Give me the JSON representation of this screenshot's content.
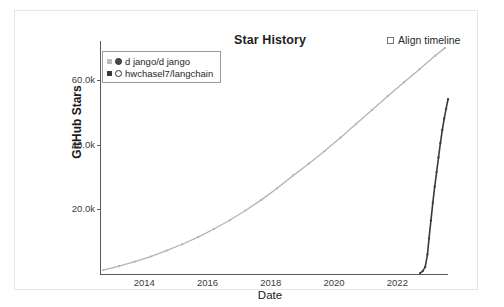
{
  "card": {
    "background": "#ffffff",
    "border_color": "#e6e6e6"
  },
  "header": {
    "title": "Star History",
    "align_timeline_label": "Align timeline",
    "align_timeline_checked": false
  },
  "chart_data": {
    "type": "line",
    "title": "Star History",
    "xlabel": "Date",
    "ylabel": "GitHub Stars",
    "grid": false,
    "legend_position": "top-left",
    "xlim": [
      2012.6,
      2023.6
    ],
    "ylim": [
      0,
      72000
    ],
    "x_ticks": [
      "2014",
      "2016",
      "2018",
      "2020",
      "2022"
    ],
    "x_tick_values": [
      2014,
      2016,
      2018,
      2020,
      2022
    ],
    "y_ticks": [
      "20.0k",
      "40.0k",
      "60.0k"
    ],
    "y_tick_values": [
      20000,
      40000,
      60000
    ],
    "series": [
      {
        "name": "d jango/d jango",
        "color": "#b4b4b4",
        "marker": "circle",
        "x": [
          2012.7,
          2013.2,
          2013.7,
          2014.2,
          2014.7,
          2015.2,
          2015.7,
          2016.2,
          2016.7,
          2017.2,
          2017.7,
          2018.2,
          2018.7,
          2019.2,
          2019.7,
          2020.2,
          2020.7,
          2021.2,
          2021.7,
          2022.2,
          2022.7,
          2023.2,
          2023.5
        ],
        "values": [
          1200,
          2400,
          3800,
          5400,
          7200,
          9200,
          11400,
          13900,
          16600,
          19600,
          22900,
          26500,
          30400,
          34100,
          38000,
          42100,
          46400,
          50700,
          55000,
          59200,
          63300,
          67500,
          69800
        ]
      },
      {
        "name": "hwchasel7/langchain",
        "color": "#3a3a3a",
        "marker": "circle",
        "x": [
          2022.72,
          2022.8,
          2022.88,
          2022.95,
          2023.0,
          2023.06,
          2023.12,
          2023.18,
          2023.24,
          2023.3,
          2023.36,
          2023.42,
          2023.48,
          2023.54,
          2023.6
        ],
        "values": [
          300,
          900,
          2200,
          6000,
          11000,
          16500,
          22000,
          27000,
          31500,
          36000,
          40500,
          44500,
          48000,
          51000,
          54000
        ]
      }
    ]
  }
}
